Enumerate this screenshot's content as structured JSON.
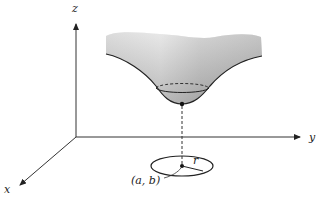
{
  "diagram": {
    "type": "3d-surface-sketch",
    "axes": {
      "z_label": "z",
      "y_label": "y",
      "x_label": "x"
    },
    "annotations": {
      "point_label": "(a, b)",
      "radius_label": "r"
    },
    "colors": {
      "axis": "#333333",
      "surface_light": "#e4e4e4",
      "surface_dark": "#9a9a9a",
      "outline": "#222222",
      "background": "#ffffff"
    }
  }
}
